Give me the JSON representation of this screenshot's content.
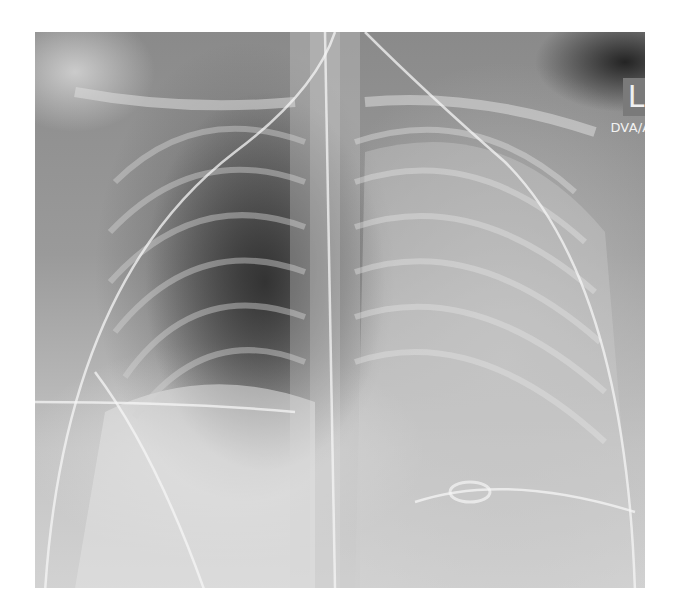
{
  "image": {
    "type": "chest-radiograph",
    "view": "frontal",
    "side_marker": "L",
    "marker_caption": "DVA/AO"
  }
}
